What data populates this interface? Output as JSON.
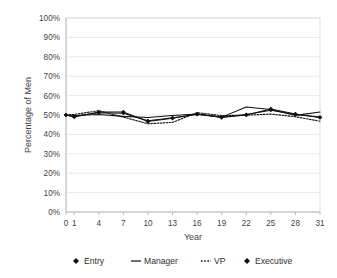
{
  "chart_data": {
    "type": "line",
    "title": "",
    "xlabel": "Year",
    "ylabel": "Percentage of Men",
    "xlim": [
      0,
      31
    ],
    "ylim": [
      0,
      1
    ],
    "grid": true,
    "legend_position": "bottom",
    "x_ticks": [
      "0",
      "1",
      "4",
      "7",
      "10",
      "13",
      "16",
      "19",
      "22",
      "25",
      "28",
      "31"
    ],
    "x_tick_values": [
      0,
      1,
      4,
      7,
      10,
      13,
      16,
      19,
      22,
      25,
      28,
      31
    ],
    "y_ticks": [
      "0%",
      "10%",
      "20%",
      "30%",
      "40%",
      "50%",
      "60%",
      "70%",
      "80%",
      "90%",
      "100%"
    ],
    "y_tick_values": [
      0,
      0.1,
      0.2,
      0.3,
      0.4,
      0.5,
      0.6,
      0.7,
      0.8,
      0.9,
      1.0
    ],
    "x": [
      0,
      1,
      4,
      7,
      10,
      13,
      16,
      19,
      22,
      25,
      28,
      31
    ],
    "series": [
      {
        "name": "Entry",
        "style": "solid-marker",
        "values": [
          0.5,
          0.49,
          0.515,
          0.515,
          0.467,
          0.483,
          0.505,
          0.487,
          0.5,
          0.531,
          0.505,
          0.487
        ]
      },
      {
        "name": "Manager",
        "style": "solid",
        "values": [
          0.5,
          0.497,
          0.503,
          0.493,
          0.487,
          0.497,
          0.505,
          0.489,
          0.541,
          0.528,
          0.498,
          0.515
        ]
      },
      {
        "name": "VP",
        "style": "dotted",
        "values": [
          0.5,
          0.503,
          0.522,
          0.489,
          0.455,
          0.462,
          0.512,
          0.497,
          0.499,
          0.505,
          0.491,
          0.468
        ]
      },
      {
        "name": "Executive",
        "style": "solid-marker",
        "values": [
          0.5,
          0.494,
          0.512,
          0.509,
          0.47,
          0.486,
          0.503,
          0.49,
          0.503,
          0.525,
          0.503,
          0.489
        ]
      }
    ]
  },
  "legend": {
    "items": [
      {
        "label": "Entry",
        "marker": "diamond-marker"
      },
      {
        "label": "Manager",
        "marker": "solid-line-marker"
      },
      {
        "label": "VP",
        "marker": "dotted-line-marker"
      },
      {
        "label": "Executive",
        "marker": "diamond-marker"
      }
    ]
  },
  "colors": {
    "series": "#111111",
    "grid": "#e2e2e2",
    "axis": "#b6b6b6",
    "text": "#3f3f3f",
    "background": "#ffffff"
  }
}
